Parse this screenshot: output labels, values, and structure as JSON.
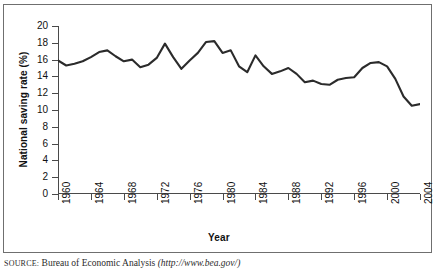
{
  "figure": {
    "source_prefix": "SOURCE:",
    "source_text": "Bureau of Economic Analysis",
    "source_url": "(http://www.bea.gov/)"
  },
  "chart_data": {
    "type": "line",
    "title": "",
    "xlabel": "Year",
    "ylabel": "National saving rate (%)",
    "xlim": [
      1960,
      2004
    ],
    "ylim": [
      0,
      20
    ],
    "ytick_step": 2,
    "xtick_step": 4,
    "grid": false,
    "legend": "none",
    "line_color": "#2b2b2b",
    "yticks": [
      0,
      2,
      4,
      6,
      8,
      10,
      12,
      14,
      16,
      18,
      20
    ],
    "xticks": [
      1960,
      1964,
      1968,
      1972,
      1976,
      1980,
      1984,
      1988,
      1992,
      1996,
      2000,
      2004
    ],
    "x": [
      1960,
      1961,
      1962,
      1963,
      1964,
      1965,
      1966,
      1967,
      1968,
      1969,
      1970,
      1971,
      1972,
      1973,
      1974,
      1975,
      1976,
      1977,
      1978,
      1979,
      1980,
      1981,
      1982,
      1983,
      1984,
      1985,
      1986,
      1987,
      1988,
      1989,
      1990,
      1991,
      1992,
      1993,
      1994,
      1995,
      1996,
      1997,
      1998,
      1999,
      2000,
      2001,
      2002,
      2003,
      2004
    ],
    "values": [
      15.9,
      15.3,
      15.5,
      15.8,
      16.3,
      16.9,
      17.1,
      16.4,
      15.8,
      16.0,
      15.1,
      15.4,
      16.2,
      17.9,
      16.3,
      14.9,
      15.9,
      16.8,
      18.1,
      18.2,
      16.8,
      17.1,
      15.2,
      14.5,
      16.5,
      15.2,
      14.3,
      14.6,
      15.0,
      14.3,
      13.3,
      13.5,
      13.1,
      13.0,
      13.6,
      13.8,
      13.9,
      15.0,
      15.6,
      15.7,
      15.2,
      13.7,
      11.6,
      10.5,
      10.7
    ],
    "annotations": []
  }
}
